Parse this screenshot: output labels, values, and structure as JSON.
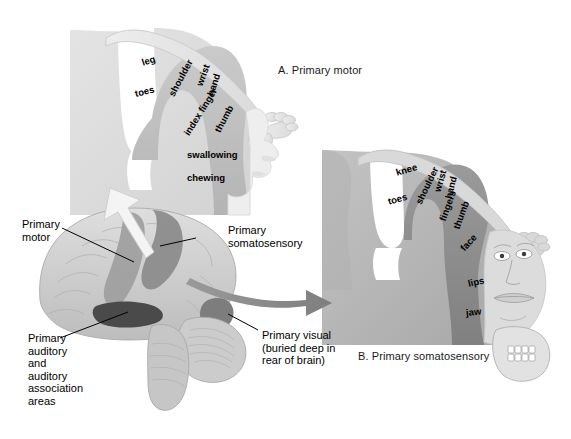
{
  "figure": {
    "panels": [
      {
        "id": "A",
        "caption": "A. Primary motor"
      },
      {
        "id": "B",
        "caption": "B. Primary somatosensory"
      }
    ]
  },
  "panel_a": {
    "caption": "A. Primary motor",
    "homunculus_labels": [
      {
        "text": "leg",
        "rotation": -18
      },
      {
        "text": "toes",
        "rotation": -14
      },
      {
        "text": "shoulder",
        "rotation": -62
      },
      {
        "text": "wrist",
        "rotation": -70
      },
      {
        "text": "hand",
        "rotation": -72
      },
      {
        "text": "index finger",
        "rotation": -58
      },
      {
        "text": "thumb",
        "rotation": -62
      },
      {
        "text": "swallowing",
        "rotation": 0
      },
      {
        "text": "chewing",
        "rotation": 0
      }
    ],
    "figure_parts": [
      "arm",
      "hand",
      "face-profile"
    ]
  },
  "panel_b": {
    "caption": "B. Primary somatosensory",
    "homunculus_labels": [
      {
        "text": "knee",
        "rotation": -16
      },
      {
        "text": "toes",
        "rotation": -16
      },
      {
        "text": "shoulder",
        "rotation": -64
      },
      {
        "text": "wrist",
        "rotation": -74
      },
      {
        "text": "hand",
        "rotation": -76
      },
      {
        "text": "fingers",
        "rotation": -70
      },
      {
        "text": "thumb",
        "rotation": -70
      },
      {
        "text": "face",
        "rotation": -48
      },
      {
        "text": "lips",
        "rotation": -12
      },
      {
        "text": "jaw",
        "rotation": -6
      }
    ],
    "figure_parts": [
      "arm",
      "hand",
      "face-frontal",
      "teeth-jaw"
    ]
  },
  "brain_diagram": {
    "labels": [
      {
        "key": "primary_motor",
        "lines": [
          "Primary",
          "motor"
        ]
      },
      {
        "key": "primary_somatosensory",
        "lines": [
          "Primary",
          "somatosensory"
        ]
      },
      {
        "key": "primary_auditory",
        "lines": [
          "Primary",
          "auditory",
          "and",
          "auditory",
          "association",
          "areas"
        ]
      },
      {
        "key": "primary_visual",
        "lines": [
          "Primary visual",
          "(buried deep in",
          "rear of brain)"
        ]
      }
    ],
    "regions": [
      "primary-motor-strip",
      "primary-somatosensory-strip",
      "primary-auditory-area",
      "primary-visual-area",
      "cerebellum",
      "brainstem"
    ],
    "arrows": [
      {
        "name": "arrow-to-panel-a",
        "direction": "up-left",
        "color": "#f2f2f2"
      },
      {
        "name": "arrow-to-panel-b",
        "direction": "right",
        "color": "#8f8f8f"
      }
    ]
  },
  "colors": {
    "panel_a_cortex": "#dcdcdc",
    "panel_a_gyrus": "#c2c2c2",
    "panel_b_cortex": "#b5b5b5",
    "panel_b_gyrus": "#8e8e8e",
    "brain_base": "#d4d4d4",
    "brain_motor": "#9e9e9e",
    "brain_somatosensory": "#8c8c8c",
    "brain_auditory": "#4a4a4a",
    "label_text": "#000000",
    "background": "#ffffff"
  }
}
